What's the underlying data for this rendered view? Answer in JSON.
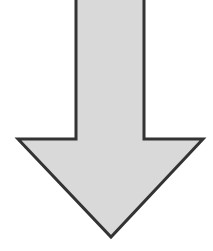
{
  "figure": {
    "icon": "arrow-down-icon",
    "direction": "down",
    "colors": {
      "background": "#ffffff",
      "fill": "#d9d9d9",
      "stroke": "#333333"
    },
    "stroke_width": 3,
    "points": "76,-4 76,139 18,139 111,237 203,139 144,139 144,-4"
  }
}
